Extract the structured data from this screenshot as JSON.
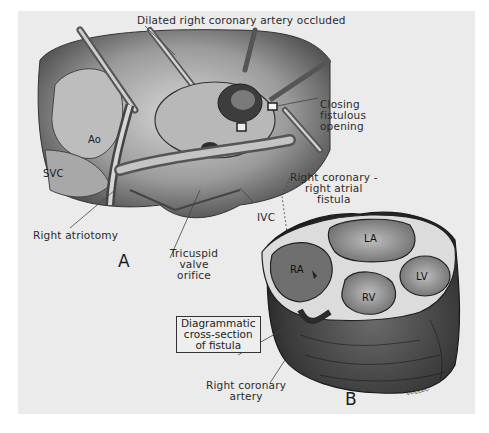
{
  "figure": {
    "panel_a": {
      "letter": "A",
      "labels": {
        "top": "Dilated right coronary artery occluded",
        "closing": [
          "Closing",
          "fistulous",
          "opening"
        ],
        "ao": "Ao",
        "svc": "SVC",
        "right_atriotomy": "Right atriotomy",
        "ivc": "IVC",
        "fistula": [
          "Right coronary -",
          "right atrial",
          "fistula"
        ],
        "tricuspid": [
          "Tricuspid",
          "valve",
          "orifice"
        ]
      }
    },
    "panel_b": {
      "letter": "B",
      "chambers": {
        "ra": "RA",
        "la": "LA",
        "lv": "LV",
        "rv": "RV"
      },
      "boxed_label": [
        "Diagrammatic",
        "cross-section",
        "of fistula"
      ],
      "right_coronary_artery": [
        "Right coronary",
        "artery"
      ],
      "signature": "signature"
    },
    "colors": {
      "background": "#ebebeb",
      "ink": "#2a2a2a",
      "tissue_dark": "#3a3a3a",
      "tissue_mid": "#8a8a8a",
      "tissue_light": "#c8c8c8"
    }
  }
}
